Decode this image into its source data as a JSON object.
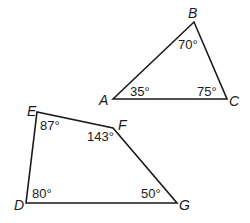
{
  "triangle": {
    "vertices": {
      "A": {
        "label": "A",
        "x": 113,
        "y": 99
      },
      "B": {
        "label": "B",
        "x": 194,
        "y": 22
      },
      "C": {
        "label": "C",
        "x": 227,
        "y": 99
      }
    },
    "angles": {
      "A": "35°",
      "B": "70°",
      "C": "75°"
    }
  },
  "quadrilateral": {
    "vertices": {
      "D": {
        "label": "D",
        "x": 26,
        "y": 203
      },
      "E": {
        "label": "E",
        "x": 37,
        "y": 112
      },
      "F": {
        "label": "F",
        "x": 113,
        "y": 128
      },
      "G": {
        "label": "G",
        "x": 177,
        "y": 203
      }
    },
    "angles": {
      "D": "80°",
      "E": "87°",
      "F": "143°",
      "G": "50°"
    }
  },
  "colors": {
    "stroke": "#1a1a1a",
    "background": "#ffffff"
  }
}
